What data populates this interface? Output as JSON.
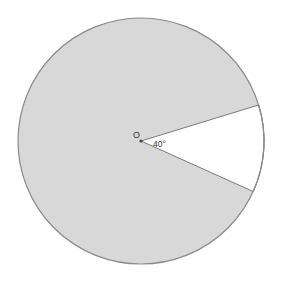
{
  "diagram": {
    "type": "circle-sector",
    "center_label": "O",
    "angle_label": "40°",
    "angle_degrees": 40,
    "colors": {
      "circle_fill": "#d8d8d8",
      "circle_stroke": "#8a8a8a",
      "sector_fill": "#ffffff",
      "line_color": "#7a7a7a",
      "background": "#ffffff"
    }
  }
}
